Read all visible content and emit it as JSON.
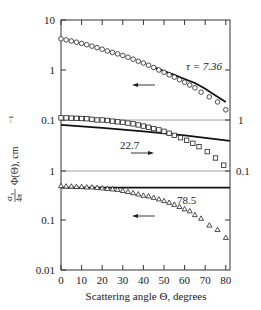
{
  "chart_data": {
    "type": "scatter",
    "title": "",
    "xlabel": "Scattering angle Θ, degrees",
    "ylabel": "σs/4π Φ(Θ), cm⁻¹",
    "x_ticks": [
      0,
      10,
      20,
      30,
      40,
      50,
      60,
      70,
      80
    ],
    "xlim": [
      0,
      82
    ],
    "y_scale": "log",
    "left_y_ticks": [
      "10",
      "1",
      "0.1",
      "1",
      "0.1",
      "0.01"
    ],
    "right_y_ticks": [
      "1",
      "0.1"
    ],
    "grid": false,
    "legend": null,
    "panels": [
      {
        "name": "tau-7.36",
        "ylim": [
          0.1,
          10
        ],
        "annotation": "τ = 7.36",
        "arrow_direction": "left",
        "marker": "circle",
        "series": [
          {
            "name": "measured (circles)",
            "x": [
              0,
              2.5,
              5,
              7.5,
              10,
              12.5,
              15,
              17.5,
              20,
              22.5,
              25,
              27.5,
              30,
              32.5,
              35,
              37.5,
              40,
              42.5,
              45,
              47.5,
              50,
              52.5,
              55,
              57.5,
              60,
              62.5,
              65,
              68,
              72,
              76,
              80
            ],
            "values": [
              4.2,
              4.0,
              3.8,
              3.6,
              3.4,
              3.2,
              3.0,
              2.8,
              2.6,
              2.4,
              2.25,
              2.1,
              1.95,
              1.8,
              1.65,
              1.5,
              1.38,
              1.25,
              1.12,
              1.0,
              0.9,
              0.8,
              0.72,
              0.64,
              0.57,
              0.5,
              0.44,
              0.36,
              0.29,
              0.23,
              0.16
            ]
          },
          {
            "name": "calculated (solid line)",
            "x": [
              45,
              50,
              55,
              60,
              65,
              70,
              75,
              80
            ],
            "values": [
              1.15,
              0.95,
              0.8,
              0.66,
              0.55,
              0.42,
              0.31,
              0.23
            ]
          }
        ]
      },
      {
        "name": "tau-22.7",
        "ylim": [
          0.1,
          1
        ],
        "annotation": "22.7",
        "arrow_direction": "right",
        "marker": "square",
        "series": [
          {
            "name": "measured (squares)",
            "x": [
              0,
              2.5,
              5,
              7.5,
              10,
              12.5,
              15,
              17.5,
              20,
              22.5,
              25,
              27.5,
              30,
              32.5,
              35,
              37.5,
              40,
              42.5,
              45,
              47.5,
              50,
              52.5,
              55,
              58,
              61,
              64,
              67,
              71,
              75,
              79
            ],
            "values": [
              1.1,
              1.1,
              1.09,
              1.08,
              1.07,
              1.06,
              1.03,
              1.0,
              1.0,
              0.98,
              0.95,
              0.92,
              0.9,
              0.87,
              0.84,
              0.8,
              0.76,
              0.72,
              0.68,
              0.64,
              0.6,
              0.55,
              0.5,
              0.45,
              0.4,
              0.35,
              0.3,
              0.24,
              0.18,
              0.13
            ]
          },
          {
            "name": "calculated (solid line)",
            "x": [
              0,
              20,
              40,
              60,
              82
            ],
            "values": [
              0.8,
              0.7,
              0.6,
              0.5,
              0.39
            ]
          }
        ]
      },
      {
        "name": "tau-78.5",
        "ylim": [
          0.01,
          1
        ],
        "annotation": "78.5",
        "arrow_direction": "left",
        "marker": "triangle",
        "series": [
          {
            "name": "measured (triangles)",
            "x": [
              0,
              2.5,
              5,
              7.5,
              10,
              12.5,
              15,
              17.5,
              20,
              22.5,
              25,
              27.5,
              30,
              32.5,
              35,
              37.5,
              40,
              42.5,
              45,
              47.5,
              50,
              52.5,
              55,
              57.5,
              60,
              62.5,
              65,
              68,
              72,
              76,
              80
            ],
            "values": [
              0.5,
              0.49,
              0.49,
              0.48,
              0.48,
              0.47,
              0.47,
              0.46,
              0.45,
              0.44,
              0.43,
              0.42,
              0.4,
              0.38,
              0.36,
              0.34,
              0.32,
              0.31,
              0.29,
              0.27,
              0.25,
              0.23,
              0.21,
              0.19,
              0.17,
              0.155,
              0.13,
              0.11,
              0.08,
              0.065,
              0.045
            ]
          },
          {
            "name": "calculated (solid line)",
            "x": [
              0,
              82
            ],
            "values": [
              0.46,
              0.46
            ]
          }
        ]
      }
    ]
  },
  "labels": {
    "x_tick_labels": [
      "0",
      "10",
      "20",
      "30",
      "40",
      "50",
      "60",
      "70",
      "80"
    ],
    "xlabel": "Scattering angle Θ, degrees",
    "ylabel_fraction_num": "σ",
    "ylabel_fraction_sub": "s",
    "ylabel_fraction_den": "4π",
    "ylabel_rest": "Φ(Θ), cm",
    "ylabel_sup": "−1",
    "left_ticks": [
      {
        "label": "10",
        "y": 20
      },
      {
        "label": "1",
        "y": 70
      },
      {
        "label": "0.1",
        "y": 120
      },
      {
        "label": "1",
        "y": 171
      },
      {
        "label": "0.1",
        "y": 220
      },
      {
        "label": "0.01",
        "y": 270
      }
    ],
    "right_ticks": [
      {
        "label": "1",
        "y": 120
      },
      {
        "label": "0.1",
        "y": 171
      }
    ],
    "annotations": {
      "tau1": "τ = 7.36",
      "tau2": "22.7",
      "tau3": "78.5"
    }
  }
}
